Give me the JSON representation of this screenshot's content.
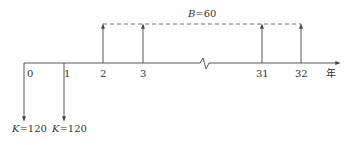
{
  "diagram": {
    "type": "cash-flow-timeline",
    "axis_unit_label": "年",
    "ticks": [
      {
        "label": "0",
        "x": 24
      },
      {
        "label": "1",
        "x": 64
      },
      {
        "label": "2",
        "x": 103
      },
      {
        "label": "3",
        "x": 143
      },
      {
        "label": "31",
        "x": 262
      },
      {
        "label": "32",
        "x": 301
      }
    ],
    "outflows": [
      {
        "period": "0",
        "var": "K",
        "eq": "=120"
      },
      {
        "period": "1",
        "var": "K",
        "eq": "=120"
      }
    ],
    "inflows": {
      "periods": [
        "2",
        "3",
        "31",
        "32"
      ],
      "var": "B",
      "eq": "=60"
    },
    "colors": {
      "line": "#444444",
      "text": "#333333"
    }
  }
}
